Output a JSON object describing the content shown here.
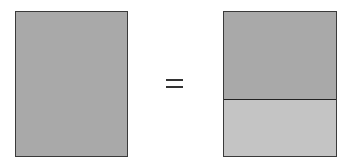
{
  "diagram": {
    "operator": "=",
    "left_shape": {
      "type": "rectangle",
      "fill": "#a9a9a9",
      "parts": 1
    },
    "right_shape": {
      "type": "rectangle",
      "parts": 2,
      "top_fill": "#a9a9a9",
      "bottom_fill": "#c4c4c4",
      "split": "horizontal"
    }
  }
}
